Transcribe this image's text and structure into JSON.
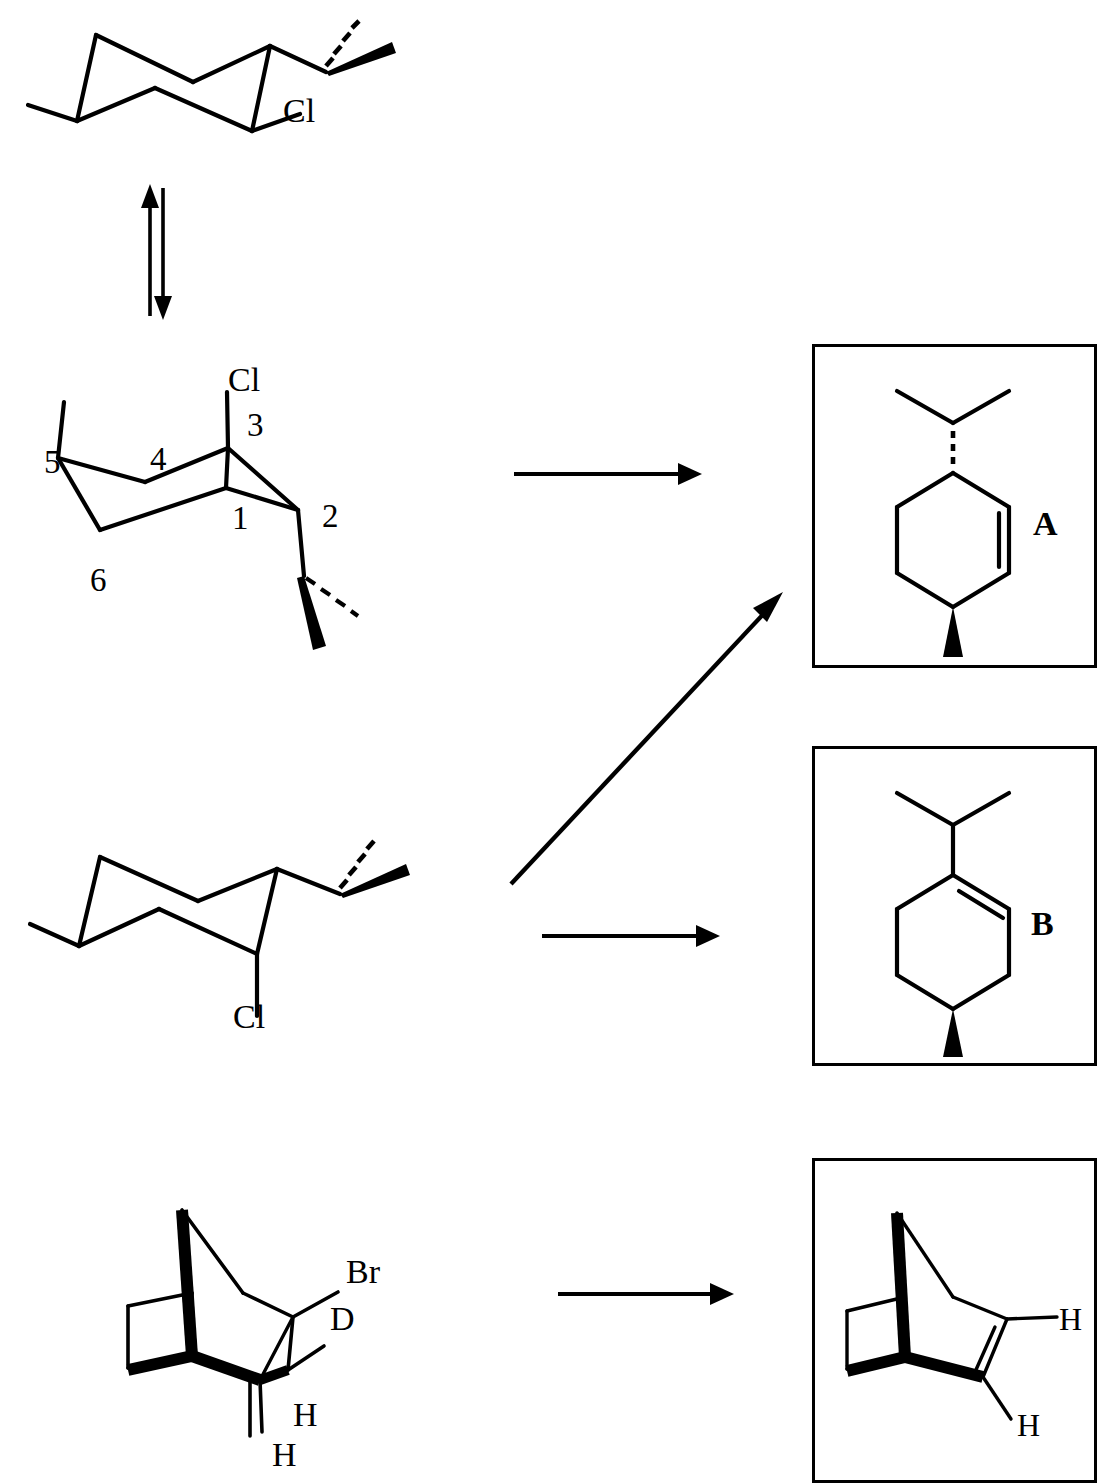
{
  "page": {
    "width": 1114,
    "height": 1483,
    "background": "#ffffff",
    "ink": "#000000",
    "header": {
      "folio": "800",
      "title": "STEREOCHEMISTRY OF BIMOLECULAR ELIMINATION"
    }
  },
  "scheme": {
    "reactant_top": {
      "name": "chair-conformer-equatorial-chloride",
      "labels": [
        {
          "key": "cl",
          "text": "Cl"
        }
      ],
      "substituents": [
        "isopropyl-wedge-hash",
        "methyl",
        "Cl"
      ]
    },
    "equilibrium": {
      "name": "ring-flip-equilibrium-arrows",
      "direction": "up-down"
    },
    "reactant_numbered": {
      "name": "chair-conformer-axial-chloride-numbered",
      "labels": [
        {
          "key": "cl",
          "text": "Cl"
        },
        {
          "key": "c1",
          "text": "1"
        },
        {
          "key": "c2",
          "text": "2"
        },
        {
          "key": "c3",
          "text": "3"
        },
        {
          "key": "c4",
          "text": "4"
        },
        {
          "key": "c5",
          "text": "5"
        },
        {
          "key": "c6",
          "text": "6"
        }
      ]
    },
    "reactant_lower": {
      "name": "chair-conformer-axial-chloride-down",
      "labels": [
        {
          "key": "cl",
          "text": "Cl"
        }
      ]
    },
    "reactant_bicyclic": {
      "name": "bromo-deuterio-norbornane",
      "labels": [
        {
          "key": "br",
          "text": "Br"
        },
        {
          "key": "d",
          "text": "D"
        },
        {
          "key": "h1",
          "text": "H"
        },
        {
          "key": "h2",
          "text": "H"
        }
      ]
    },
    "arrows": [
      {
        "key": "arrow-numbered-to-a",
        "type": "reaction-arrow-horizontal"
      },
      {
        "key": "arrow-lower-to-a",
        "type": "reaction-arrow-diagonal"
      },
      {
        "key": "arrow-lower-to-b",
        "type": "reaction-arrow-horizontal"
      },
      {
        "key": "arrow-bicyclic-to-product",
        "type": "reaction-arrow-horizontal"
      }
    ]
  },
  "products": [
    {
      "key": "A",
      "label": "A",
      "name": "product-a-cyclohexene",
      "description": "4-isopropyl-1-methylcyclohex-2-ene, isopropyl hashed, methyl bold wedge"
    },
    {
      "key": "B",
      "label": "B",
      "name": "product-b-cyclohexene",
      "description": "1-isopropyl-4-methylcyclohexene, methyl bold wedge"
    },
    {
      "key": "C",
      "label": "",
      "name": "product-c-norbornene",
      "description": "norbornene bearing two vinylic hydrogens",
      "labels": [
        {
          "key": "h1",
          "text": "H"
        },
        {
          "key": "h2",
          "text": "H"
        }
      ]
    }
  ]
}
